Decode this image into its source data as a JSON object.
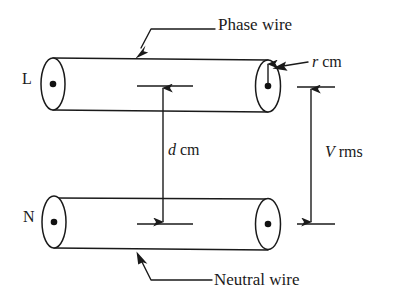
{
  "figure": {
    "background_color": "#ffffff",
    "stroke_color": "#1a1a1a",
    "width": 394,
    "height": 305
  },
  "labels": {
    "phase_wire": "Phase wire",
    "neutral_wire": "Neutral wire",
    "terminal_live": "L",
    "terminal_neutral": "N",
    "radius_symbol": "r",
    "radius_unit": "cm",
    "separation_symbol": "d",
    "separation_unit": "cm",
    "voltage_symbol": "V",
    "voltage_unit": "rms"
  },
  "annotations": {
    "radius_dimension": "r cm",
    "separation_dimension": "d cm",
    "voltage_dimension": "V rms"
  },
  "conductors": [
    {
      "name": "phase-conductor",
      "terminal": "L",
      "callout": "Phase wire",
      "position": "top"
    },
    {
      "name": "neutral-conductor",
      "terminal": "N",
      "callout": "Neutral wire",
      "position": "bottom"
    }
  ]
}
